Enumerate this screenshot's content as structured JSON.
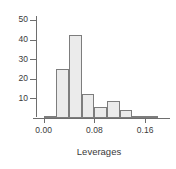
{
  "figure": {
    "background_color": "#ffffff",
    "bar_fill_color": "#ebebeb",
    "bar_border_color": "#7d7d7d",
    "axis_color": "#6e6e6e",
    "text_color": "#3a3a3a"
  },
  "chart_data": {
    "type": "bar",
    "title": "",
    "subtitle": "",
    "xlabel": "Leverages",
    "ylabel": "",
    "grid": false,
    "legend": false,
    "legend_position": "none",
    "xlim": [
      -0.012,
      0.196
    ],
    "ylim": [
      0,
      52
    ],
    "xticks": [
      0.0,
      0.08,
      0.16
    ],
    "xtick_labels": [
      "0.00",
      "0.08",
      "0.16"
    ],
    "yticks": [
      10,
      20,
      30,
      40,
      50
    ],
    "ytick_labels": [
      "10",
      "20",
      "30",
      "40",
      "50"
    ],
    "bin_width": 0.02,
    "bin_edges": [
      0.0,
      0.02,
      0.04,
      0.06,
      0.08,
      0.1,
      0.12,
      0.14,
      0.16,
      0.18
    ],
    "categories": [
      "0.00-0.02",
      "0.02-0.04",
      "0.04-0.06",
      "0.06-0.08",
      "0.08-0.10",
      "0.10-0.12",
      "0.12-0.14",
      "0.14-0.16",
      "0.16-0.18"
    ],
    "values": [
      1,
      25,
      42.5,
      12,
      5.5,
      8.5,
      4,
      1,
      1
    ],
    "bars": [
      {
        "label": "0.00-0.02",
        "x0": 0.0,
        "x1": 0.02,
        "value": 1
      },
      {
        "label": "0.02-0.04",
        "x0": 0.02,
        "x1": 0.04,
        "value": 25
      },
      {
        "label": "0.04-0.06",
        "x0": 0.04,
        "x1": 0.06,
        "value": 42.5
      },
      {
        "label": "0.06-0.08",
        "x0": 0.06,
        "x1": 0.08,
        "value": 12
      },
      {
        "label": "0.08-0.10",
        "x0": 0.08,
        "x1": 0.1,
        "value": 5.5
      },
      {
        "label": "0.10-0.12",
        "x0": 0.1,
        "x1": 0.12,
        "value": 8.5
      },
      {
        "label": "0.12-0.14",
        "x0": 0.12,
        "x1": 0.14,
        "value": 4
      },
      {
        "label": "0.14-0.16",
        "x0": 0.14,
        "x1": 0.16,
        "value": 1
      },
      {
        "label": "0.16-0.18",
        "x0": 0.16,
        "x1": 0.18,
        "value": 1
      }
    ]
  }
}
